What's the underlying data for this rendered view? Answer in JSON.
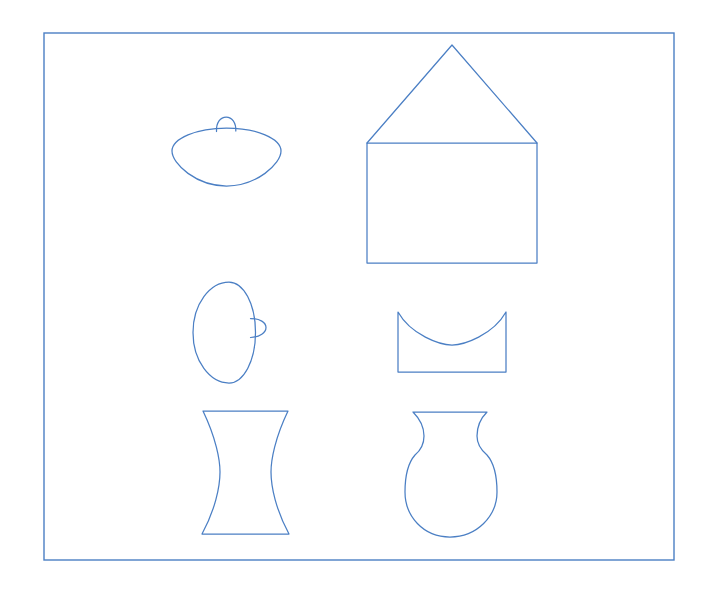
{
  "page": {
    "kind": "line-drawing",
    "width": 709,
    "height": 589,
    "background_color": "#ffffff"
  },
  "style": {
    "ink_color": "#4b7fc4",
    "paper_color": "#ffffff",
    "stroke_width": 1.25
  },
  "frame": {
    "label": "outer-border",
    "x": 44,
    "y": 33,
    "width": 630,
    "height": 527,
    "color": "#4b7fc4"
  },
  "figures": [
    {
      "id": "lid-horizontal",
      "label": "Wide ellipse lid with top knob",
      "row": 1,
      "column": 1,
      "bbox": {
        "x": 171,
        "y": 113,
        "width": 111,
        "height": 74
      },
      "path": "M 172 151 C 172 138.5 196.5 128 226.5 128 C 256.5 128 281 138.5 281 151 C 281 164 256.5 186 226.5 186 C 196.5 186 172 164 172 151 Z"
    },
    {
      "id": "lid-horizontal-knob",
      "label": "Small knob on lid top",
      "row": 1,
      "column": 1,
      "bbox": {
        "x": 215,
        "y": 114,
        "width": 22,
        "height": 17
      },
      "path": "M 216.5 131.5 C 216.0 122.5 220.5 117.0 226.2 117.0 C 231.9 117.0 236.2 122.5 235.8 131.0"
    },
    {
      "id": "house-body",
      "label": "Rectangle body of house",
      "row": 1,
      "column": 2,
      "bbox": {
        "x": 367,
        "y": 143,
        "width": 170,
        "height": 120
      },
      "path": "M 367 143 L 537 143 L 537 263 L 367 263 Z"
    },
    {
      "id": "house-roof",
      "label": "Triangular roof of house",
      "row": 1,
      "column": 2,
      "bbox": {
        "x": 367,
        "y": 45,
        "width": 170,
        "height": 98
      },
      "path": "M 367 143 L 452 45 L 537 143"
    },
    {
      "id": "lid-vertical",
      "label": "Vertical ellipse lid with side knob",
      "row": 2,
      "column": 1,
      "bbox": {
        "x": 192,
        "y": 281,
        "width": 64,
        "height": 103
      },
      "path": "M 229 282 C 243.5 282 255.5 304 255.5 332.5 C 255.5 361 243.5 383 229 383 C 210 383 193 361 193 332.5 C 193 304 210 282 229 282 Z"
    },
    {
      "id": "lid-vertical-knob",
      "label": "Small knob on lid right side",
      "row": 2,
      "column": 1,
      "bbox": {
        "x": 249,
        "y": 316,
        "width": 19,
        "height": 24
      },
      "path": "M 250.5 318.5 C 260.0 318.5 266.0 322.5 266.0 327.5 C 266.0 332.5 260.0 337.0 250.5 337.5"
    },
    {
      "id": "bowl",
      "label": "Rectangle with concave curved top edge",
      "row": 2,
      "column": 2,
      "bbox": {
        "x": 397,
        "y": 311,
        "width": 110,
        "height": 62
      },
      "path": "M 398 312 C 411 335 440 345 452 345 C 464 345 493 335 506 312 L 506 372 L 398 372 Z"
    },
    {
      "id": "hourglass",
      "label": "Cylinder with concave sides (hourglass)",
      "row": 3,
      "column": 1,
      "bbox": {
        "x": 201,
        "y": 408,
        "width": 89,
        "height": 128
      },
      "path": "M 203 411 L 288 411 C 275 438 271 460 271 472 C 271 487 276 510 289 534 L 202 534 C 215 510 220 487 220 472 C 220 460 216 438 203 411 Z"
    },
    {
      "id": "vase",
      "label": "Vase with flared rim and round body",
      "row": 3,
      "column": 2,
      "bbox": {
        "x": 405,
        "y": 409,
        "width": 92,
        "height": 128
      },
      "path": "M 413 412 L 487 412 C 479 420 477 427 477 436 C 477 444 481 450 487 455 C 494 463 497 478 497 492 C 497 516 477 537 450 537 C 423 537 405 516 405 492 C 405 478 408 463 415 455 C 421 450 424 444 424 436 C 424 427 421 420 413 412 Z"
    }
  ]
}
